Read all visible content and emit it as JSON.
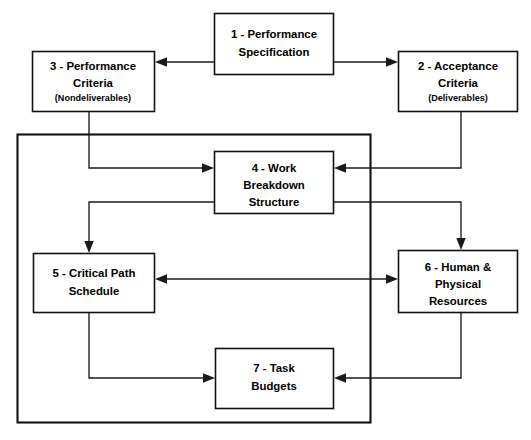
{
  "diagram": {
    "line_color": "#1a1a1a",
    "box_fill": "#ffffff",
    "background": "#ffffff",
    "boxes": [
      {
        "id": "box-1",
        "name": "performance-specification",
        "lines": [
          "1 - Performance",
          "Specification"
        ],
        "sub": ""
      },
      {
        "id": "box-2",
        "name": "acceptance-criteria",
        "lines": [
          "2 - Acceptance",
          "Criteria"
        ],
        "sub": "(Deliverables)"
      },
      {
        "id": "box-3",
        "name": "performance-criteria",
        "lines": [
          "3 - Performance",
          "Criteria"
        ],
        "sub": "(Nondeliverables)"
      },
      {
        "id": "box-4",
        "name": "work-breakdown-structure",
        "lines": [
          "4 - Work",
          "Breakdown",
          "Structure"
        ],
        "sub": ""
      },
      {
        "id": "box-5",
        "name": "critical-path-schedule",
        "lines": [
          "5 - Critical Path",
          "Schedule"
        ],
        "sub": ""
      },
      {
        "id": "box-6",
        "name": "human-physical-resources",
        "lines": [
          "6 - Human &",
          "Physical",
          "Resources"
        ],
        "sub": ""
      },
      {
        "id": "box-7",
        "name": "task-budgets",
        "lines": [
          "7 - Task",
          "Budgets"
        ],
        "sub": ""
      }
    ],
    "text": {
      "b1l1": "1 - Performance",
      "b1l2": "Specification",
      "b2l1": "2 - Acceptance",
      "b2l2": "Criteria",
      "b2l3": "(Deliverables)",
      "b3l1": "3 - Performance",
      "b3l2": "Criteria",
      "b3l3": "(Nondeliverables)",
      "b4l1": "4 - Work",
      "b4l2": "Breakdown",
      "b4l3": "Structure",
      "b5l1": "5 - Critical Path",
      "b5l2": "Schedule",
      "b6l1": "6 - Human &",
      "b6l2": "Physical",
      "b6l3": "Resources",
      "b7l1": "7 - Task",
      "b7l2": "Budgets"
    },
    "connectors": [
      {
        "name": "spec-to-performance-criteria",
        "direction": "left"
      },
      {
        "name": "spec-to-acceptance-criteria",
        "direction": "right"
      },
      {
        "name": "performance-criteria-to-wbs",
        "direction": "right"
      },
      {
        "name": "acceptance-criteria-to-wbs",
        "direction": "left"
      },
      {
        "name": "wbs-to-critical-path-schedule",
        "direction": "down"
      },
      {
        "name": "wbs-to-human-physical-resources",
        "direction": "down"
      },
      {
        "name": "schedule-resources-bidirectional",
        "direction": "both"
      },
      {
        "name": "schedule-to-task-budgets",
        "direction": "right"
      },
      {
        "name": "resources-to-task-budgets",
        "direction": "left"
      }
    ]
  }
}
